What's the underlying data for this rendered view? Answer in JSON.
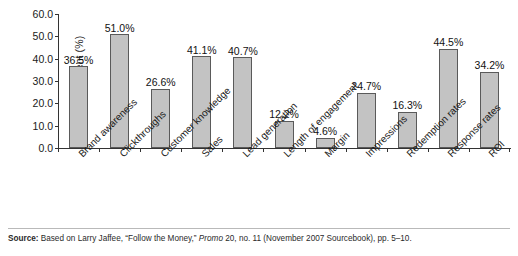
{
  "chart_data": {
    "type": "bar",
    "title": "",
    "xlabel": "",
    "ylabel": "Percent (%)",
    "ylim": [
      0,
      60
    ],
    "ytick_step": 10,
    "ytick_labels": [
      "0.0",
      "10.0",
      "20.0",
      "30.0",
      "40.0",
      "50.0",
      "60.0"
    ],
    "grid": false,
    "legend": false,
    "bar_color": "#c3c3c3",
    "bar_edge_color": "#5a5a5a",
    "categories": [
      "Brand awareness",
      "Clickthroughs",
      "Customer knowledge",
      "Sales",
      "Lead generation",
      "Length of engagement",
      "Margin",
      "Impressions",
      "Redemption rates",
      "Response rates",
      "ROI"
    ],
    "values": [
      36.5,
      51.0,
      26.6,
      41.1,
      40.7,
      12.2,
      4.6,
      24.7,
      16.3,
      44.5,
      34.2
    ],
    "data_labels": [
      "36.5%",
      "51.0%",
      "26.6%",
      "41.1%",
      "40.7%",
      "12.2%",
      "4.6%",
      "24.7%",
      "16.3%",
      "44.5%",
      "34.2%"
    ]
  },
  "footer": {
    "source_prefix": "Source:",
    "source_part1": " Based on Larry Jaffee, “Follow the Money,” ",
    "source_italic": "Promo",
    "source_part2": " 20, no. 11 (November 2007 Sourcebook), pp. 5–10."
  }
}
